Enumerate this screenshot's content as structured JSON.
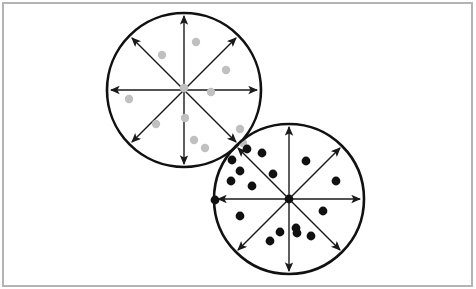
{
  "figure": {
    "canvas": {
      "width": 476,
      "height": 289,
      "background": "#ffffff"
    },
    "frame": {
      "name": "outer-border",
      "x": 3,
      "y": 3,
      "width": 469,
      "height": 283,
      "stroke": "#b4b4b4",
      "stroke_width": 2,
      "fill": "#ffffff"
    }
  },
  "chart_data": {
    "type": "scatter",
    "subtitle": "",
    "xlabel": "",
    "ylabel": "",
    "grid": false,
    "legend_position": "none",
    "axis_ranges": {
      "xlim": [
        0,
        476
      ],
      "ylim": [
        0,
        289
      ]
    },
    "coordinate_note": "All coordinates are pixel positions in the 476x289 image; y increases downward.",
    "annotations": [
      {
        "name": "sector-divider-arrows",
        "description": "Each circle is split into eight equal 45-degree sectors by four double-headed arrows passing through the center: horizontal, vertical, and two diagonals.",
        "count_per_circle": 4,
        "arrowheads_per_line": 2,
        "sectors_per_circle": 8
      },
      {
        "name": "circle-overlap",
        "description": "The two circles overlap in a small lens-shaped region near the lower-right edge of the gray circle and the upper-left edge of the black circle."
      }
    ],
    "shapes": [
      {
        "name": "gray-circle",
        "kind": "circle",
        "label": "Upper-left circle (light gray points)",
        "cx": 184,
        "cy": 90,
        "r": 77,
        "stroke": "#111111",
        "stroke_width": 2.6,
        "fill": "none",
        "sector_count": 8,
        "axis_stroke": "#1a1a1a",
        "axis_stroke_width": 1.4
      },
      {
        "name": "black-circle",
        "kind": "circle",
        "label": "Lower-right circle (black points)",
        "cx": 289,
        "cy": 199,
        "r": 75,
        "stroke": "#111111",
        "stroke_width": 2.6,
        "fill": "none",
        "sector_count": 8,
        "axis_stroke": "#1a1a1a",
        "axis_stroke_width": 1.4
      }
    ],
    "series": [
      {
        "name": "Gray points (upper-left circle)",
        "marker": "filled-circle",
        "color": "#c0c0c0",
        "marker_radius": 4.2,
        "count": 12,
        "points": [
          {
            "x": 196,
            "y": 42
          },
          {
            "x": 162,
            "y": 55
          },
          {
            "x": 226,
            "y": 70
          },
          {
            "x": 129,
            "y": 99
          },
          {
            "x": 211,
            "y": 92
          },
          {
            "x": 156,
            "y": 124
          },
          {
            "x": 185,
            "y": 118
          },
          {
            "x": 240,
            "y": 129
          },
          {
            "x": 194,
            "y": 140
          },
          {
            "x": 205,
            "y": 148
          },
          {
            "x": 184,
            "y": 88
          },
          {
            "x": 243,
            "y": 143
          }
        ]
      },
      {
        "name": "Black points (lower-right circle)",
        "marker": "filled-circle",
        "color": "#111111",
        "marker_radius": 4.4,
        "count": 18,
        "points": [
          {
            "x": 247,
            "y": 149
          },
          {
            "x": 262,
            "y": 153
          },
          {
            "x": 232,
            "y": 160
          },
          {
            "x": 240,
            "y": 171
          },
          {
            "x": 273,
            "y": 174
          },
          {
            "x": 231,
            "y": 181
          },
          {
            "x": 252,
            "y": 186
          },
          {
            "x": 306,
            "y": 161
          },
          {
            "x": 336,
            "y": 181
          },
          {
            "x": 240,
            "y": 216
          },
          {
            "x": 323,
            "y": 211
          },
          {
            "x": 296,
            "y": 228
          },
          {
            "x": 280,
            "y": 232
          },
          {
            "x": 297,
            "y": 233
          },
          {
            "x": 311,
            "y": 236
          },
          {
            "x": 270,
            "y": 241
          },
          {
            "x": 215,
            "y": 200
          },
          {
            "x": 289,
            "y": 199
          }
        ]
      }
    ]
  }
}
